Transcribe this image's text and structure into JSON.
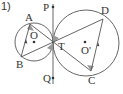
{
  "problem_number": "1)",
  "labels": {
    "A": "A",
    "B": "B",
    "C": "C",
    "D": "D",
    "O": "O",
    "O2": "O'",
    "T": "T",
    "P": "P",
    "Q": "Q"
  },
  "colors": {
    "line": "#555555",
    "angle": "#9a9a9a",
    "text": "#333333"
  }
}
